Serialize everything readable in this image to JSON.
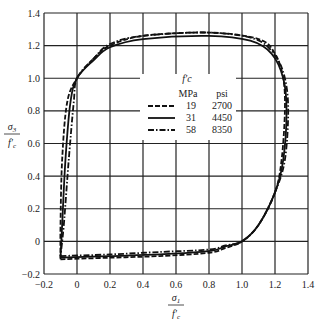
{
  "chart_data": {
    "type": "line",
    "title": "",
    "xlabel": "σ1 / f'c",
    "ylabel": "σ3 / f'c",
    "xlim": [
      -0.2,
      1.4
    ],
    "ylim": [
      -0.2,
      1.4
    ],
    "grid": true,
    "x_ticks": [
      "-0.2",
      "0",
      "0.2",
      "0.4",
      "0.6",
      "0.8",
      "1.0",
      "1.2",
      "1.4"
    ],
    "y_ticks": [
      "-0.2",
      "0",
      "0.2",
      "0.4",
      "0.6",
      "0.8",
      "1.0",
      "1.2",
      "1.4"
    ],
    "legend": {
      "title": "f'c",
      "position": "center",
      "columns": [
        "MPa",
        "psi"
      ],
      "entries": [
        {
          "style": "dashed",
          "mpa": "19",
          "psi": "2700"
        },
        {
          "style": "solid",
          "mpa": "31",
          "psi": "4450"
        },
        {
          "style": "dash-dot",
          "mpa": "58",
          "psi": "8350"
        }
      ]
    },
    "series": [
      {
        "name": "19 MPa (2700 psi)",
        "style": "dashed",
        "points": [
          [
            -0.1,
            -0.11
          ],
          [
            0.2,
            -0.1
          ],
          [
            0.5,
            -0.09
          ],
          [
            0.8,
            -0.07
          ],
          [
            0.9,
            -0.04
          ],
          [
            1.0,
            0.0
          ],
          [
            1.1,
            0.1
          ],
          [
            1.2,
            0.3
          ],
          [
            1.24,
            0.5
          ],
          [
            1.26,
            0.8
          ],
          [
            1.25,
            1.0
          ],
          [
            1.2,
            1.15
          ],
          [
            1.1,
            1.24
          ],
          [
            0.8,
            1.28
          ],
          [
            0.4,
            1.26
          ],
          [
            0.2,
            1.2
          ],
          [
            0.1,
            1.12
          ],
          [
            0.0,
            1.0
          ],
          [
            -0.06,
            0.85
          ],
          [
            -0.09,
            0.5
          ],
          [
            -0.1,
            0.1
          ],
          [
            -0.1,
            -0.11
          ]
        ]
      },
      {
        "name": "31 MPa (4450 psi)",
        "style": "solid",
        "points": [
          [
            -0.1,
            -0.1
          ],
          [
            0.2,
            -0.09
          ],
          [
            0.5,
            -0.08
          ],
          [
            0.8,
            -0.06
          ],
          [
            0.9,
            -0.03
          ],
          [
            1.0,
            0.0
          ],
          [
            1.1,
            0.1
          ],
          [
            1.2,
            0.3
          ],
          [
            1.25,
            0.5
          ],
          [
            1.27,
            0.8
          ],
          [
            1.25,
            1.0
          ],
          [
            1.18,
            1.15
          ],
          [
            1.05,
            1.23
          ],
          [
            0.8,
            1.26
          ],
          [
            0.4,
            1.24
          ],
          [
            0.2,
            1.19
          ],
          [
            0.1,
            1.11
          ],
          [
            0.0,
            1.0
          ],
          [
            -0.04,
            0.85
          ],
          [
            -0.07,
            0.5
          ],
          [
            -0.09,
            0.1
          ],
          [
            -0.1,
            -0.1
          ]
        ]
      },
      {
        "name": "58 MPa (8350 psi)",
        "style": "dash-dot",
        "points": [
          [
            -0.1,
            -0.09
          ],
          [
            0.2,
            -0.08
          ],
          [
            0.5,
            -0.065
          ],
          [
            0.8,
            -0.05
          ],
          [
            0.9,
            -0.025
          ],
          [
            1.0,
            0.0
          ],
          [
            1.1,
            0.1
          ],
          [
            1.2,
            0.3
          ],
          [
            1.26,
            0.5
          ],
          [
            1.28,
            0.8
          ],
          [
            1.26,
            1.0
          ],
          [
            1.2,
            1.14
          ],
          [
            1.08,
            1.24
          ],
          [
            0.8,
            1.28
          ],
          [
            0.4,
            1.26
          ],
          [
            0.2,
            1.21
          ],
          [
            0.1,
            1.12
          ],
          [
            0.0,
            1.0
          ],
          [
            -0.02,
            0.85
          ],
          [
            -0.05,
            0.5
          ],
          [
            -0.08,
            0.1
          ],
          [
            -0.1,
            -0.09
          ]
        ]
      }
    ]
  }
}
